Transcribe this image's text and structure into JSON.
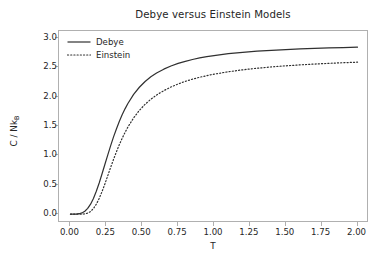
{
  "chart_data": {
    "type": "line",
    "title": "Debye versus Einstein Models",
    "xlabel": "T",
    "ylabel": "C / Nk",
    "ylabel_sub": "B",
    "xlim": [
      -0.08,
      2.08
    ],
    "ylim": [
      -0.15,
      3.12
    ],
    "xticks": [
      0.0,
      0.25,
      0.5,
      0.75,
      1.0,
      1.25,
      1.5,
      1.75,
      2.0
    ],
    "xticklabels": [
      "0.00",
      "0.25",
      "0.50",
      "0.75",
      "1.00",
      "1.25",
      "1.50",
      "1.75",
      "2.00"
    ],
    "yticks": [
      0.0,
      0.5,
      1.0,
      1.5,
      2.0,
      2.5,
      3.0
    ],
    "yticklabels": [
      "0.0",
      "0.5",
      "1.0",
      "1.5",
      "2.0",
      "2.5",
      "3.0"
    ],
    "grid": false,
    "legend_position": "upper left",
    "line_color": "#303030",
    "axes_color": "#b0b0b0",
    "background": "#ffffff",
    "x": [
      0.0,
      0.02,
      0.04,
      0.06,
      0.08,
      0.1,
      0.12,
      0.14,
      0.16,
      0.18,
      0.2,
      0.22,
      0.24,
      0.26,
      0.28,
      0.3,
      0.32,
      0.34,
      0.36,
      0.38,
      0.4,
      0.44,
      0.48,
      0.52,
      0.56,
      0.6,
      0.65,
      0.7,
      0.75,
      0.8,
      0.85,
      0.9,
      0.95,
      1.0,
      1.1,
      1.2,
      1.3,
      1.4,
      1.5,
      1.6,
      1.7,
      1.8,
      1.9,
      2.0
    ],
    "series": [
      {
        "name": "Debye",
        "style": "solid",
        "color": "#303030",
        "values": [
          0.0,
          0.0,
          0.002,
          0.008,
          0.022,
          0.05,
          0.098,
          0.17,
          0.268,
          0.39,
          0.532,
          0.688,
          0.85,
          1.01,
          1.168,
          1.316,
          1.452,
          1.578,
          1.692,
          1.794,
          1.886,
          2.04,
          2.162,
          2.26,
          2.34,
          2.404,
          2.47,
          2.524,
          2.568,
          2.604,
          2.635,
          2.661,
          2.683,
          2.702,
          2.733,
          2.757,
          2.776,
          2.791,
          2.804,
          2.815,
          2.824,
          2.832,
          2.838,
          2.844
        ]
      },
      {
        "name": "Einstein",
        "style": "dotted",
        "color": "#303030",
        "values": [
          0.0,
          0.0,
          0.0,
          0.0,
          0.001,
          0.005,
          0.018,
          0.046,
          0.096,
          0.17,
          0.268,
          0.386,
          0.518,
          0.658,
          0.798,
          0.934,
          1.062,
          1.182,
          1.292,
          1.392,
          1.484,
          1.64,
          1.768,
          1.872,
          1.958,
          2.03,
          2.104,
          2.166,
          2.218,
          2.262,
          2.3,
          2.332,
          2.36,
          2.385,
          2.426,
          2.459,
          2.486,
          2.508,
          2.527,
          2.543,
          2.557,
          2.569,
          2.58,
          2.589
        ]
      }
    ],
    "annotations": []
  },
  "legend": {
    "entries": [
      {
        "label": "Debye"
      },
      {
        "label": "Einstein"
      }
    ]
  }
}
